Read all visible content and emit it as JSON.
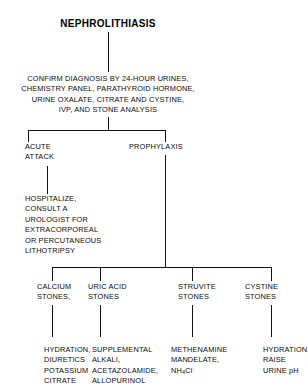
{
  "diagram": {
    "title": "NEPHROLITHIASIS",
    "workup": "CONFIRM DIAGNOSIS BY 24-HOUR URINES,\nCHEMISTRY PANEL, PARATHYROID HORMONE,\nURINE OXALATE, CITRATE AND CYSTINE,\nIVP, AND STONE ANALYSIS",
    "branches": {
      "acute_attack": "ACUTE\nATTACK",
      "acute_treatment": "HOSPITALIZE,\nCONSULT A\nUROLOGIST FOR\nEXTRACORPOREAL\nOR PERCUTANEOUS\nLITHOTRIPSY",
      "prophylaxis": "PROPHYLAXIS"
    },
    "stone_types": [
      {
        "name": "CALCIUM\nSTONES,",
        "treatment": "HYDRATION,\nDIURETICS\nPOTASSIUM\nCITRATE"
      },
      {
        "name": "URIC ACID\nSTONES",
        "treatment": "SUPPLEMENTAL\nALKALI,\nACETAZOLAMIDE,\nALLOPURINOL"
      },
      {
        "name": "STRUVITE\nSTONES",
        "treatment_line1": "METHENAMINE",
        "treatment_line2": "MANDELATE,",
        "treatment_formula_pre": "NH",
        "treatment_formula_sub": "4",
        "treatment_formula_post": "Cl"
      },
      {
        "name": "CYSTINE\nSTONES",
        "treatment": "HYDRATION,\nRAISE\nURINE pH"
      }
    ],
    "colors": {
      "background": "#ffffff",
      "text": "#000000",
      "connector": "#111111"
    }
  }
}
